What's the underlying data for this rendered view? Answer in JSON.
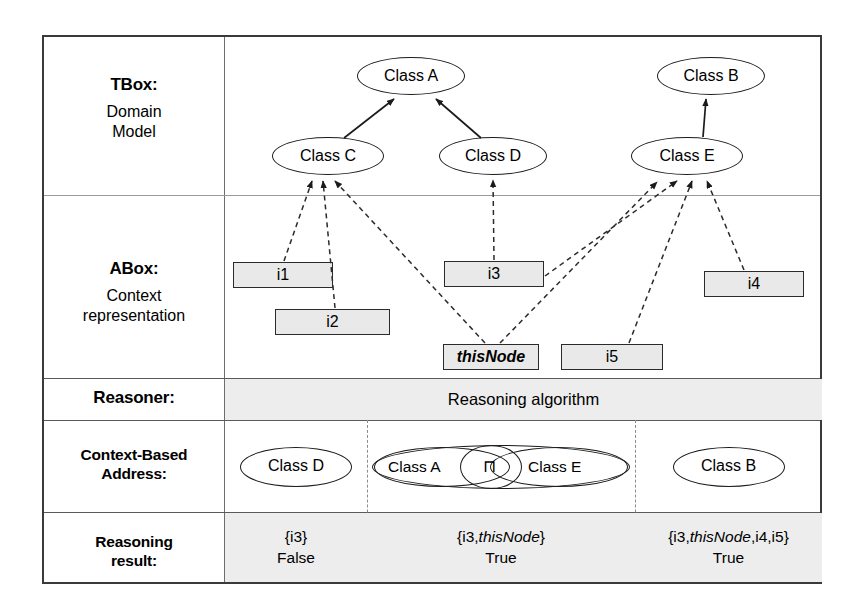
{
  "figure": {
    "rows": [
      {
        "title": "TBox:",
        "subtitle": "Domain\nModel"
      },
      {
        "title": "ABox:",
        "subtitle": "Context\nrepresentation"
      },
      {
        "title": "Reasoner:",
        "subtitle": ""
      },
      {
        "title": "Context-Based\nAddress:",
        "subtitle": ""
      },
      {
        "title": "Reasoning\nresult:",
        "subtitle": ""
      }
    ],
    "tbox": {
      "classes": [
        {
          "id": "A",
          "label": "Class A"
        },
        {
          "id": "B",
          "label": "Class B"
        },
        {
          "id": "C",
          "label": "Class C"
        },
        {
          "id": "D",
          "label": "Class D"
        },
        {
          "id": "E",
          "label": "Class E"
        }
      ],
      "subclass_edges": [
        {
          "from": "C",
          "to": "A"
        },
        {
          "from": "D",
          "to": "A"
        },
        {
          "from": "E",
          "to": "B"
        }
      ]
    },
    "abox": {
      "instances": [
        {
          "id": "i1",
          "label": "i1",
          "italic": false
        },
        {
          "id": "i2",
          "label": "i2",
          "italic": false
        },
        {
          "id": "i3",
          "label": "i3",
          "italic": false
        },
        {
          "id": "i4",
          "label": "i4",
          "italic": false
        },
        {
          "id": "i5",
          "label": "i5",
          "italic": false
        },
        {
          "id": "thisNode",
          "label": "thisNode",
          "italic": true
        }
      ],
      "membership_edges": [
        {
          "from": "i1",
          "to": "C"
        },
        {
          "from": "i2",
          "to": "C"
        },
        {
          "from": "thisNode",
          "to": "C"
        },
        {
          "from": "thisNode",
          "to": "E"
        },
        {
          "from": "i3",
          "to": "D"
        },
        {
          "from": "i3",
          "to": "E"
        },
        {
          "from": "i4",
          "to": "E"
        },
        {
          "from": "i5",
          "to": "E"
        }
      ]
    },
    "reasoner": {
      "label": "Reasoning algorithm"
    },
    "context_based_address": {
      "columns": [
        {
          "expr": "Class D",
          "parts": [
            "Class D"
          ]
        },
        {
          "expr": "Class A ⊓ Class E",
          "parts": [
            "Class A",
            "⊓",
            "Class E"
          ]
        },
        {
          "expr": "Class B",
          "parts": [
            "Class B"
          ]
        }
      ]
    },
    "reasoning_result": {
      "columns": [
        {
          "set": "{i3}",
          "value": "False"
        },
        {
          "set": "{i3,thisNode}",
          "value": "True"
        },
        {
          "set": "{i3,thisNode,i4,i5}",
          "value": "True"
        }
      ]
    },
    "colors": {
      "frame": "#3a3a3a",
      "grid": "#9a9a9a",
      "instance_fill": "#e9e9e9",
      "band_fill": "#ededed"
    }
  }
}
